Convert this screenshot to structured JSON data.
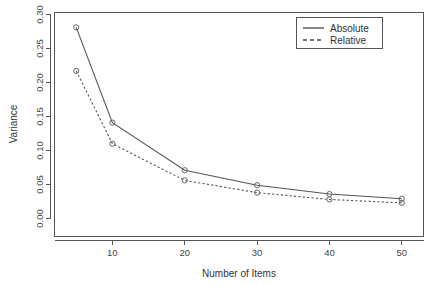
{
  "chart_data": {
    "type": "line",
    "title": "",
    "xlabel": "Number of Items",
    "ylabel": "Variance",
    "x": [
      5,
      10,
      20,
      30,
      40,
      50
    ],
    "series": [
      {
        "name": "Absolute",
        "style": "solid",
        "marker": "circle",
        "values": [
          0.281,
          0.141,
          0.071,
          0.049,
          0.036,
          0.029
        ]
      },
      {
        "name": "Relative",
        "style": "dashed",
        "marker": "circle",
        "values": [
          0.217,
          0.11,
          0.056,
          0.038,
          0.028,
          0.023
        ]
      }
    ],
    "xlim": [
      2,
      53
    ],
    "ylim": [
      0.0,
      0.3
    ],
    "xticks": [
      10,
      20,
      30,
      40,
      50
    ],
    "xtick_labels": [
      "10",
      "20",
      "30",
      "40",
      "50"
    ],
    "yticks": [
      0.0,
      0.05,
      0.1,
      0.15,
      0.2,
      0.25,
      0.3
    ],
    "ytick_labels": [
      "0.00",
      "0.05",
      "0.10",
      "0.15",
      "0.20",
      "0.25",
      "0.30"
    ],
    "grid": false,
    "legend": {
      "position": "top-right",
      "entries": [
        {
          "label": "Absolute",
          "style": "solid"
        },
        {
          "label": "Relative",
          "style": "dashed"
        }
      ]
    },
    "colors": {
      "line": "#555555",
      "axis": "#555555",
      "text": "#333333",
      "background": "#ffffff"
    }
  }
}
